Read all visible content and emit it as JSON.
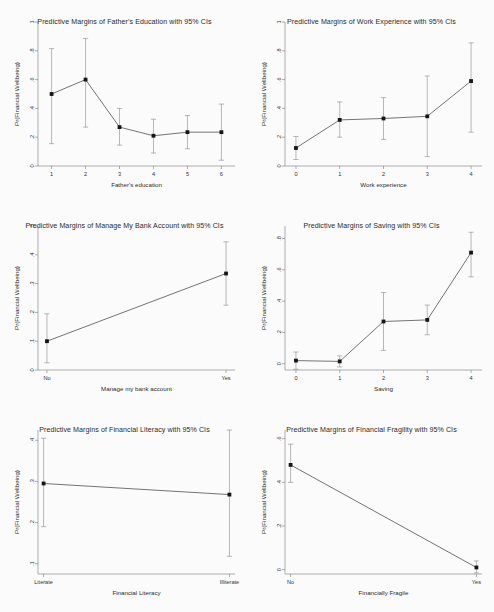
{
  "figure": {
    "background_color": "#fbfbfb",
    "marker_color": "#161616",
    "line_color": "#3a3a3a",
    "ci_color": "#8a8a8a",
    "axis_color": "#7a7a7a",
    "shared_ylabel": "Pr(Financial Wellbeing)",
    "panel_count": 6
  },
  "chart_data": [
    {
      "type": "line",
      "title": "Predictive Margins of Father's Education with 95% CIs",
      "xlabel": "Father's education",
      "ylabel": "Pr(Financial Wellbeing)",
      "x": [
        1,
        2,
        3,
        4,
        5,
        6
      ],
      "xtick_labels": [
        "1",
        "2",
        "3",
        "4",
        "5",
        "6"
      ],
      "ytick_labels": [
        "0",
        ".2",
        ".4",
        ".6",
        ".8",
        "1"
      ],
      "ytick_values": [
        0,
        0.2,
        0.4,
        0.6,
        0.8,
        1
      ],
      "ylim": [
        0,
        1
      ],
      "xlim": [
        0.6,
        6.4
      ],
      "values": [
        0.5,
        0.6,
        0.27,
        0.21,
        0.235,
        0.235
      ],
      "ci_lower": [
        0.155,
        0.27,
        0.145,
        0.09,
        0.12,
        0.04
      ],
      "ci_upper": [
        0.815,
        0.885,
        0.4,
        0.325,
        0.35,
        0.43
      ],
      "grid": false,
      "legend": "none"
    },
    {
      "type": "line",
      "title": "Predictive Margins of Work Experience with 95% CIs",
      "xlabel": "Work experience",
      "ylabel": "Pr(Financial Wellbeing)",
      "x": [
        0,
        1,
        2,
        3,
        4
      ],
      "xtick_labels": [
        "0",
        "1",
        "2",
        "3",
        "4"
      ],
      "ytick_labels": [
        "0",
        ".2",
        ".4",
        ".6",
        ".8",
        "1"
      ],
      "ytick_values": [
        0,
        0.2,
        0.4,
        0.6,
        0.8,
        1
      ],
      "ylim": [
        0,
        1
      ],
      "xlim": [
        -0.25,
        4.25
      ],
      "values": [
        0.125,
        0.32,
        0.33,
        0.345,
        0.59
      ],
      "ci_lower": [
        0.045,
        0.2,
        0.185,
        0.065,
        0.235
      ],
      "ci_upper": [
        0.205,
        0.445,
        0.475,
        0.625,
        0.855
      ],
      "grid": false,
      "legend": "none"
    },
    {
      "type": "line",
      "title": "Predictive Margins of Manage My Bank Account with 95% CIs",
      "xlabel": "Manage my bank account",
      "ylabel": "Pr(Financial Wellbeing)",
      "x": [
        0,
        1
      ],
      "xtick_labels": [
        "No",
        "Yes"
      ],
      "ytick_labels": [
        "0",
        ".1",
        ".2",
        ".3",
        ".4",
        ".5"
      ],
      "ytick_values": [
        0,
        0.1,
        0.2,
        0.3,
        0.4,
        0.5
      ],
      "ylim": [
        0,
        0.5
      ],
      "xlim": [
        -0.05,
        1.05
      ],
      "values": [
        0.1,
        0.335
      ],
      "ci_lower": [
        0.025,
        0.225
      ],
      "ci_upper": [
        0.195,
        0.445
      ],
      "grid": false,
      "legend": "none"
    },
    {
      "type": "line",
      "title": "Predictive Margins of Saving with 95% CIs",
      "xlabel": "Saving",
      "ylabel": "Pr(Financial Wellbeing)",
      "x": [
        0,
        1,
        2,
        3,
        4
      ],
      "xtick_labels": [
        "0",
        "1",
        "2",
        "3",
        "4"
      ],
      "ytick_labels": [
        "0",
        ".2",
        ".4",
        ".6",
        ".8"
      ],
      "ytick_values": [
        0,
        0.2,
        0.4,
        0.6,
        0.8
      ],
      "ylim": [
        -0.04,
        0.88
      ],
      "xlim": [
        -0.25,
        4.25
      ],
      "values": [
        0.02,
        0.015,
        0.27,
        0.28,
        0.71
      ],
      "ci_lower": [
        -0.035,
        -0.02,
        0.085,
        0.185,
        0.555
      ],
      "ci_upper": [
        0.075,
        0.05,
        0.455,
        0.375,
        0.84
      ],
      "grid": false,
      "legend": "none"
    },
    {
      "type": "line",
      "title": "Predictive Margins of Financial Literacy with 95% CIs",
      "xlabel": "Financial Literacy",
      "ylabel": "Pr(Financial Wellbeing)",
      "x": [
        0,
        1
      ],
      "xtick_labels": [
        "Literate",
        "Illiterate"
      ],
      "ytick_labels": [
        ".1",
        ".2",
        ".3",
        ".4"
      ],
      "ytick_values": [
        0.1,
        0.2,
        0.3,
        0.4
      ],
      "ylim": [
        0.075,
        0.425
      ],
      "xlim": [
        -0.03,
        1.03
      ],
      "values": [
        0.295,
        0.268
      ],
      "ci_lower": [
        0.19,
        0.118
      ],
      "ci_upper": [
        0.405,
        0.425
      ],
      "grid": false,
      "legend": "none"
    },
    {
      "type": "line",
      "title": "Predictive Margins of Financial Fragility with 95% CIs",
      "xlabel": "Financially Fragile",
      "ylabel": "Pr(Financial Wellbeing)",
      "x": [
        0,
        1
      ],
      "xtick_labels": [
        "No",
        "Yes"
      ],
      "ytick_labels": [
        "0",
        ".2",
        ".4",
        ".6"
      ],
      "ytick_values": [
        0,
        0.2,
        0.4,
        0.6
      ],
      "ylim": [
        -0.02,
        0.64
      ],
      "xlim": [
        -0.03,
        1.03
      ],
      "values": [
        0.48,
        0.01
      ],
      "ci_lower": [
        0.4,
        -0.015
      ],
      "ci_upper": [
        0.575,
        0.04
      ],
      "grid": false,
      "legend": "none"
    }
  ]
}
